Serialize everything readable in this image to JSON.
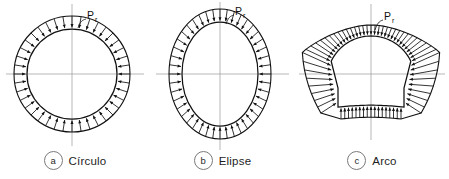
{
  "figure": {
    "background": "#ffffff",
    "ink_color": "#111111",
    "axis_color": "#9a9a9a",
    "pressure_symbol": "P",
    "pressure_subscript": "r"
  },
  "panels": [
    {
      "tag": "a",
      "label": "Círculo",
      "shape": "circle",
      "pressure_symbol": "P",
      "pressure_subscript": "r",
      "geometry": {
        "cx": 72,
        "cy": 74,
        "rx": 45,
        "ry": 45,
        "gap": 13,
        "arrows": 40
      }
    },
    {
      "tag": "b",
      "label": "Elipse",
      "shape": "ellipse",
      "pressure_symbol": "P",
      "pressure_subscript": "r",
      "geometry": {
        "cx": 70,
        "cy": 74,
        "rx": 38,
        "ry": 52,
        "gap": 13,
        "arrows": 44
      }
    },
    {
      "tag": "c",
      "label": "Arco",
      "shape": "arch",
      "pressure_symbol": "P",
      "pressure_subscript": "r",
      "geometry": {
        "cx": 76,
        "cy": 74,
        "rx": 44,
        "ry": 44,
        "arrows": 52
      }
    }
  ],
  "chart_data": {
    "type": "diagram",
    "annotations": [
      "Pr",
      "Pr",
      "Pr"
    ],
    "categories": [
      "Círculo",
      "Elipse",
      "Arco"
    ],
    "series": [
      {
        "name": "Círculo",
        "note": "Pressão radial uniforme apontando para o centro; envelope circular concêntrico",
        "arrow_count": 40,
        "uniform": true
      },
      {
        "name": "Elipse",
        "note": "Pressão radial uniforme ao longo do perímetro elíptico; envelope elíptico concêntrico",
        "arrow_count": 44,
        "uniform": true
      },
      {
        "name": "Arco",
        "note": "Pressão radial não uniforme; vetores longos nos cantos inferiores, curtos na base plana e na abóbada",
        "arrow_count": 52,
        "uniform": false
      }
    ],
    "legend_position": "below-each-panel",
    "grid": false
  }
}
